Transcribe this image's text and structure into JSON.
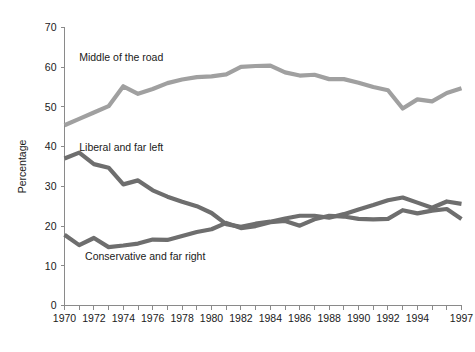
{
  "chart_data": {
    "type": "line",
    "title": "",
    "subtitle": "",
    "xlabel": "",
    "ylabel": "Percentage",
    "xlim": [
      1970,
      1997
    ],
    "ylim": [
      0,
      70
    ],
    "yticks": [
      0,
      10,
      20,
      30,
      40,
      50,
      60,
      70
    ],
    "ytick_labels": [
      "0",
      "10",
      "20",
      "30",
      "40",
      "50",
      "60",
      "70"
    ],
    "xticks": [
      1970,
      1971,
      1972,
      1973,
      1974,
      1975,
      1976,
      1977,
      1978,
      1979,
      1980,
      1981,
      1982,
      1983,
      1984,
      1985,
      1986,
      1987,
      1988,
      1989,
      1990,
      1991,
      1992,
      1993,
      1994,
      1995,
      1996,
      1997
    ],
    "xtick_labels_shown": [
      "1970",
      "1972",
      "1974",
      "1976",
      "1978",
      "1980",
      "1982",
      "1984",
      "1986",
      "1988",
      "1990",
      "1992",
      "1994",
      "1997"
    ],
    "grid": false,
    "legend_position": "inline-annotations",
    "x": [
      1970,
      1971,
      1972,
      1973,
      1974,
      1975,
      1976,
      1977,
      1978,
      1979,
      1980,
      1981,
      1982,
      1983,
      1984,
      1985,
      1986,
      1987,
      1988,
      1989,
      1990,
      1991,
      1992,
      1993,
      1994,
      1995,
      1996,
      1997
    ],
    "series": [
      {
        "name": "Middle of the road",
        "color": "#a0a0a0",
        "label_x": 1971.0,
        "label_y": 61.5,
        "values": [
          45.4,
          47.0,
          48.6,
          50.2,
          55.2,
          53.3,
          54.5,
          56.0,
          56.9,
          57.5,
          57.7,
          58.2,
          60.1,
          60.3,
          60.4,
          58.7,
          57.9,
          58.1,
          57.0,
          57.0,
          56.1,
          55.0,
          54.2,
          49.6,
          51.9,
          51.4,
          53.5,
          54.7
        ]
      },
      {
        "name": "Liberal and far left",
        "color": "#6e6e6e",
        "label_x": 1971.0,
        "label_y": 39.0,
        "values": [
          37.0,
          38.5,
          35.6,
          34.7,
          30.5,
          31.5,
          29.0,
          27.4,
          26.1,
          25.0,
          23.3,
          20.5,
          19.8,
          20.6,
          21.1,
          21.9,
          22.6,
          22.6,
          22.1,
          23.0,
          24.2,
          25.3,
          26.5,
          27.2,
          25.9,
          24.6,
          26.2,
          25.6
        ]
      },
      {
        "name": "Conservative and far right",
        "color": "#6e6e6e",
        "label_x": 1971.4,
        "label_y": 11.5,
        "values": [
          17.8,
          15.2,
          17.0,
          14.7,
          15.1,
          15.6,
          16.6,
          16.5,
          17.5,
          18.5,
          19.2,
          20.8,
          19.5,
          20.0,
          21.0,
          21.3,
          20.1,
          21.7,
          22.6,
          22.4,
          21.8,
          21.7,
          21.8,
          24.0,
          23.2,
          23.9,
          24.3,
          21.8
        ]
      }
    ],
    "annotations": [
      "Middle of the road",
      "Liberal and far left",
      "Conservative and far right"
    ]
  },
  "axes": {
    "y_title": "Percentage"
  }
}
